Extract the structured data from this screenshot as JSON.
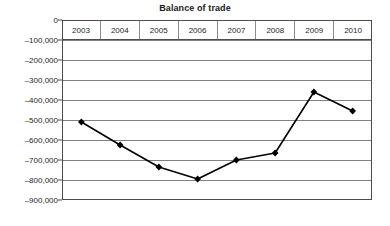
{
  "chart_data": {
    "type": "line",
    "title": "Balance of trade",
    "xlabel": "",
    "ylabel": "",
    "categories": [
      "2003",
      "2004",
      "2005",
      "2006",
      "2007",
      "2008",
      "2009",
      "2010"
    ],
    "values": [
      -510000,
      -625000,
      -735000,
      -795000,
      -700000,
      -665000,
      -360000,
      -455000
    ],
    "series": [
      {
        "name": "Balance of trade",
        "values": [
          -510000,
          -625000,
          -735000,
          -795000,
          -700000,
          -665000,
          -360000,
          -455000
        ]
      }
    ],
    "ylim": [
      -900000,
      0
    ],
    "y_ticks": [
      0,
      -100000,
      -200000,
      -300000,
      -400000,
      -500000,
      -600000,
      -700000,
      -800000,
      -900000
    ],
    "y_tick_labels": [
      "0",
      "–100,000",
      "–200,000",
      "–300,000",
      "–400,000",
      "–500,000",
      "–600,000",
      "–700,000",
      "–800,000",
      "–900,000"
    ],
    "grid": true,
    "legend": false,
    "legend_position": "none",
    "marker": "diamond",
    "line_color": "#000000",
    "marker_color": "#000000",
    "grid_color": "#808080",
    "plot_border_color": "#4d4d4d",
    "background_color": "#ffffff"
  }
}
